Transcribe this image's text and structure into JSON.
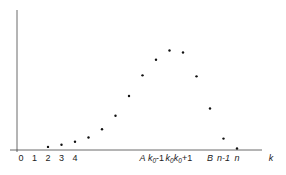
{
  "chart_data": {
    "type": "scatter",
    "title": "",
    "xlabel": "k",
    "ylabel": "",
    "grid": false,
    "legend": "none",
    "x_ticks": [
      {
        "pos": 0,
        "label": "0",
        "italic": false
      },
      {
        "pos": 1,
        "label": "1",
        "italic": false
      },
      {
        "pos": 2,
        "label": "2",
        "italic": false
      },
      {
        "pos": 3,
        "label": "3",
        "italic": false
      },
      {
        "pos": 4,
        "label": "4",
        "italic": false
      },
      {
        "pos": 9,
        "label": "A",
        "italic": true
      },
      {
        "pos": 10,
        "label": "k0-1",
        "italic": true
      },
      {
        "pos": 11,
        "label": "k0",
        "italic": true
      },
      {
        "pos": 12,
        "label": "k0+1",
        "italic": true
      },
      {
        "pos": 14,
        "label": "B",
        "italic": true
      },
      {
        "pos": 15,
        "label": "n-1",
        "italic": true
      },
      {
        "pos": 16,
        "label": "n",
        "italic": true
      }
    ],
    "x": [
      2,
      3,
      4,
      5,
      6,
      7,
      8,
      9,
      10,
      11,
      12,
      13,
      14,
      15,
      16
    ],
    "values": [
      0.03,
      0.05,
      0.08,
      0.12,
      0.2,
      0.33,
      0.52,
      0.72,
      0.87,
      0.96,
      0.94,
      0.71,
      0.4,
      0.11,
      0.0
    ],
    "xlim": [
      -0.3,
      18
    ],
    "ylim": [
      0,
      1.35
    ]
  }
}
